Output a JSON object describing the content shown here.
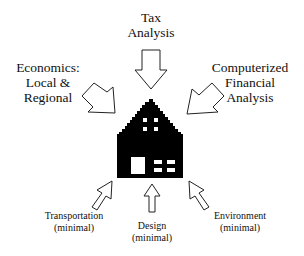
{
  "diagram": {
    "center": {
      "label": "house",
      "icon": "house-icon"
    },
    "inputs": [
      {
        "id": "tax",
        "lines": [
          "Tax",
          "Analysis"
        ],
        "position": "top",
        "arrow": "down"
      },
      {
        "id": "economics",
        "lines": [
          "Economics:",
          "Local &",
          "Regional"
        ],
        "position": "upper-left",
        "arrow": "down-right"
      },
      {
        "id": "computerized",
        "lines": [
          "Computerized",
          "Financial",
          "Analysis"
        ],
        "position": "upper-right",
        "arrow": "down-left"
      },
      {
        "id": "transportation",
        "lines": [
          "Transportation",
          "(minimal)"
        ],
        "position": "lower-left",
        "arrow": "up-right"
      },
      {
        "id": "design",
        "lines": [
          "Design",
          "(minimal)"
        ],
        "position": "bottom",
        "arrow": "up"
      },
      {
        "id": "environment",
        "lines": [
          "Environment",
          "(minimal)"
        ],
        "position": "lower-right",
        "arrow": "up-left"
      }
    ],
    "colors": {
      "ink": "#000000",
      "background": "#ffffff"
    }
  }
}
